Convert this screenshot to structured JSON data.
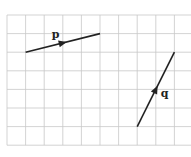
{
  "diagram": {
    "type": "vector-grid",
    "grid": {
      "origin_px": [
        7,
        15
      ],
      "cell_px": 18.6,
      "cols": 10,
      "rows": 7,
      "line_color": "#c8c8c8"
    },
    "vectors": [
      {
        "name": "p",
        "label": "p",
        "from_grid": [
          1,
          2
        ],
        "to_grid": [
          5,
          1
        ],
        "components": [
          4,
          1
        ],
        "color": "#222222"
      },
      {
        "name": "q",
        "label": "q",
        "from_grid": [
          7,
          6
        ],
        "to_grid": [
          9,
          2
        ],
        "components": [
          2,
          4
        ],
        "color": "#222222"
      }
    ]
  }
}
